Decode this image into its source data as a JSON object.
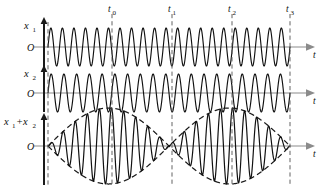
{
  "figure": {
    "background_color": "#ffffff",
    "width": 323,
    "height": 191,
    "stroke_color": "#111111",
    "axis_color": "#8b8b8b",
    "marker_color": "#5c5c5c"
  },
  "axes": [
    {
      "id": "row1",
      "ylabel_base": "x",
      "ylabel_sub": "1",
      "origin_label": "O",
      "xlabel": "t",
      "baseline_y": 47,
      "axis_x": 44,
      "axis_top": 22,
      "axis_bottom": 68,
      "x_start": 48,
      "x_end": 290,
      "arrow_x": 310
    },
    {
      "id": "row2",
      "ylabel_base": "x",
      "ylabel_sub": "2",
      "origin_label": "O",
      "xlabel": "t",
      "baseline_y": 93,
      "axis_x": 44,
      "axis_top": 70,
      "axis_bottom": 112,
      "x_start": 48,
      "x_end": 290,
      "arrow_x": 310
    },
    {
      "id": "row3",
      "ylabel_base": "x",
      "ylabel_sub": "1",
      "ylabel_base2": "+x",
      "ylabel_sub2": "2",
      "origin_label": "O",
      "xlabel": "t",
      "baseline_y": 146,
      "axis_x": 44,
      "axis_top": 118,
      "axis_bottom": 185,
      "x_start": 48,
      "x_end": 290,
      "arrow_x": 310
    }
  ],
  "time_markers": [
    {
      "id": "m_start",
      "label": "",
      "sub": "",
      "x": 48,
      "show_label": false,
      "top": 22,
      "bottom": 185
    },
    {
      "id": "m_t0",
      "label": "t",
      "sub": "0",
      "x": 112,
      "show_label": true,
      "top": 14,
      "bottom": 185
    },
    {
      "id": "m_t1",
      "label": "t",
      "sub": "1",
      "x": 172,
      "show_label": true,
      "top": 14,
      "bottom": 185
    },
    {
      "id": "m_t2",
      "label": "t",
      "sub": "2",
      "x": 232,
      "show_label": true,
      "top": 14,
      "bottom": 185
    },
    {
      "id": "m_t3",
      "label": "t",
      "sub": "3",
      "x": 290,
      "show_label": true,
      "top": 14,
      "bottom": 185
    }
  ],
  "chart_data": {
    "type": "line",
    "xlabel": "t",
    "ylabel": "displacement",
    "grid": false,
    "legend": "none",
    "xlim": [
      48,
      290
    ],
    "x_domain_px": [
      48,
      290
    ],
    "annotations": [
      "t0",
      "t1",
      "t2",
      "t3"
    ],
    "annotation_x_px": [
      112,
      172,
      232,
      290
    ],
    "annotation_meaning": [
      "t0: antinode, first beat maximum",
      "t1: node, beat minimum (waves out of phase)",
      "t2: antinode, second beat maximum",
      "t3: node, beat minimum"
    ],
    "series": [
      {
        "name": "x1",
        "label_base": "x",
        "label_sub": "1",
        "cycles": 21,
        "amplitude_px": 19,
        "baseline_y_px": 47,
        "phase_deg": 0,
        "frequency_rel": 1.0
      },
      {
        "name": "x2",
        "label_base": "x",
        "label_sub": "2",
        "cycles": 19,
        "amplitude_px": 19,
        "baseline_y_px": 93,
        "phase_deg": 0,
        "frequency_rel": 0.9048
      },
      {
        "name": "x1+x2",
        "label_base": "x",
        "label_sub": "1",
        "label_base2": "+x",
        "label_sub2": "2",
        "cycles": 20,
        "amplitude_px": 38,
        "baseline_y_px": 146,
        "beat_lobes": 2,
        "envelope": "dashed",
        "envelope_nodes_px": [
          48,
          172,
          290
        ],
        "envelope_antinodes_px": [
          112,
          232
        ]
      }
    ]
  }
}
